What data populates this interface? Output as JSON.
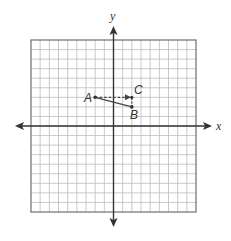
{
  "diagram": {
    "type": "coordinate-plane",
    "grid": {
      "x_min": -9,
      "x_max": 9,
      "y_min": -9,
      "y_max": 9,
      "cells_x": 18,
      "cells_y": 18,
      "line_color": "#bdbdbd",
      "border_color": "#6e6e6e"
    },
    "axes": {
      "x_label": "x",
      "y_label": "y",
      "color": "#333333"
    },
    "points": [
      {
        "id": "A",
        "label": "A",
        "x": -2,
        "y": 3
      },
      {
        "id": "B",
        "label": "B",
        "x": 2,
        "y": 2
      },
      {
        "id": "C",
        "label": "C",
        "x": 2,
        "y": 3
      }
    ],
    "segments": [
      {
        "from": "A",
        "to": "B",
        "style": "solid"
      },
      {
        "from": "A",
        "to": "C",
        "style": "dashed",
        "arrow": true
      },
      {
        "from": "C",
        "to": "B",
        "style": "dashed",
        "arrow": false
      }
    ]
  }
}
